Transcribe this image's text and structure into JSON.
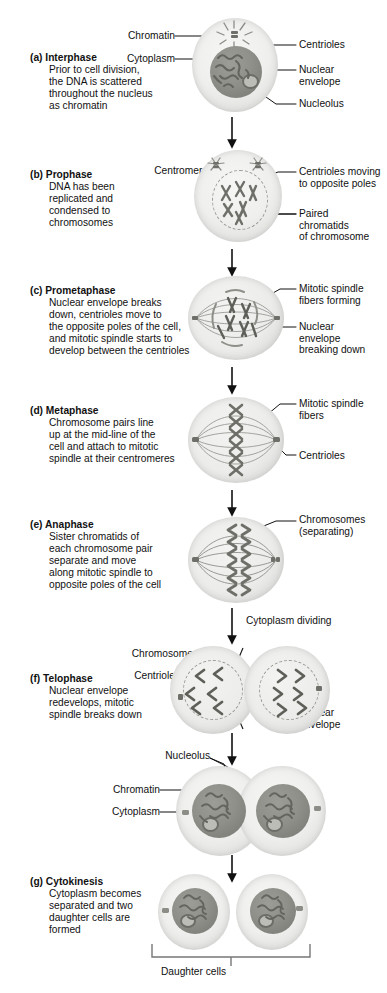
{
  "figure": {
    "ink_color": "#111111",
    "cell_color": "#e9e9e7",
    "nucleus_color": "#8c8c87",
    "chromosome_color": "#6f6f6a"
  },
  "stages": [
    {
      "id": "interphase",
      "letter": "(a)",
      "name": "Interphase",
      "description": "Prior to cell division,\nthe DNA is scattered\nthroughout the nucleus\nas chromatin",
      "labels_left": [
        "Chromatin",
        "Cytoplasm"
      ],
      "labels_right": [
        "Centrioles",
        "Nuclear\nenvelope",
        "Nucleolus"
      ]
    },
    {
      "id": "prophase",
      "letter": "(b)",
      "name": "Prophase",
      "description": "DNA has been\nreplicated and\ncondensed to\nchromosomes",
      "labels_left": [
        "Centromere"
      ],
      "labels_right": [
        "Centrioles moving\nto opposite poles",
        "Paired\nchromatids\nof chromosome"
      ]
    },
    {
      "id": "prometaphase",
      "letter": "(c)",
      "name": "Prometaphase",
      "description": "Nuclear envelope breaks\ndown, centrioles move to\nthe opposite poles of the cell,\nand mitotic spindle starts to\ndevelop between the centrioles",
      "labels_left": [],
      "labels_right": [
        "Mitotic spindle\nfibers forming",
        "Nuclear\nenvelope\nbreaking down"
      ]
    },
    {
      "id": "metaphase",
      "letter": "(d)",
      "name": "Metaphase",
      "description": "Chromosome pairs line\nup at the mid-line of the\ncell and attach to mitotic\nspindle at their centromeres",
      "labels_left": [],
      "labels_right": [
        "Mitotic spindle\nfibers",
        "Centrioles"
      ]
    },
    {
      "id": "anaphase",
      "letter": "(e)",
      "name": "Anaphase",
      "description": "Sister chromatids of\neach chromosome pair\nseparate and move\nalong mitotic spindle to\nopposite poles of the cell",
      "labels_left": [],
      "labels_right": [
        "Chromosomes\n(separating)"
      ]
    },
    {
      "id": "telophase",
      "letter": "(f)",
      "name": "Telophase",
      "description": "Nuclear envelope\nredevelops, mitotic\nspindle breaks down",
      "labels_left": [
        "Chromosomes",
        "Centrioles"
      ],
      "labels_right": [
        "Nuclear\nenvelope"
      ]
    },
    {
      "id": "cytokinesis",
      "letter": "(g)",
      "name": "Cytokinesis",
      "description": "Cytoplasm becomes\nseparated and two\ndaughter cells are\nformed",
      "labels_left": [
        "Chromatin",
        "Cytoplasm"
      ],
      "labels_right": []
    }
  ],
  "annotations": {
    "cytoplasm_dividing": "Cytoplasm dividing",
    "nucleolus_pair": "Nucleolus",
    "daughter_cells": "Daughter cells"
  }
}
